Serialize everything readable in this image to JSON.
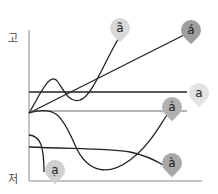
{
  "diagram": {
    "title": "",
    "y_axis": {
      "top_label": "고",
      "bottom_label": "저"
    },
    "tones": [
      {
        "label": "ã",
        "shade": "#d9d9d9"
      },
      {
        "label": "á",
        "shade": "#9e9e9e"
      },
      {
        "label": "a",
        "shade": "#e3e3e3"
      },
      {
        "label": "ả",
        "shade": "#b0b0b0"
      },
      {
        "label": "à",
        "shade": "#a8a8a8"
      },
      {
        "label": "ạ",
        "shade": "#cfcfcf"
      }
    ]
  }
}
